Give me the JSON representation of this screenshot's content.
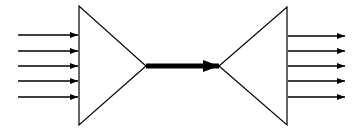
{
  "diagram": {
    "type": "fan-in / fan-out (multiplexer-demultiplexer)",
    "colors": {
      "stroke": "#000000",
      "background": "#ffffff"
    },
    "input_arrows": {
      "count": 5,
      "x_start": 18,
      "x_end": 78,
      "ys": [
        35,
        51,
        66,
        81,
        97
      ]
    },
    "left_triangle": {
      "shape": "triangle-pointing-right",
      "points": [
        [
          79,
          6
        ],
        [
          79,
          125
        ],
        [
          146,
          66
        ]
      ]
    },
    "trunk_arrow": {
      "style": "thick",
      "x_start": 146,
      "x_end": 219,
      "y": 66,
      "stroke_width": 5
    },
    "right_triangle": {
      "shape": "triangle-pointing-left",
      "points": [
        [
          287,
          7
        ],
        [
          287,
          125
        ],
        [
          219,
          66
        ]
      ]
    },
    "output_arrows": {
      "count": 5,
      "x_start": 288,
      "x_end": 345,
      "ys": [
        36,
        51,
        66,
        81,
        97
      ]
    }
  }
}
